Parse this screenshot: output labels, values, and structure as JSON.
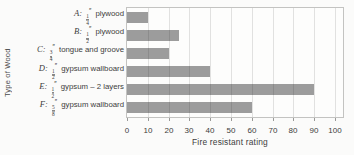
{
  "chart_data": {
    "type": "bar",
    "orientation": "horizontal",
    "title": "",
    "xlabel": "Fire resistant rating",
    "ylabel": "Type of Wood",
    "xlim": [
      0,
      100
    ],
    "xticks": [
      0,
      10,
      20,
      30,
      40,
      50,
      60,
      70,
      80,
      90,
      100
    ],
    "grid": true,
    "legend": false,
    "categories": [
      "A: 1/4″ plywood",
      "B: 1/2″ plywood",
      "C: 3/4″ tongue and groove",
      "D: 1/2″ gypsum wallboard",
      "E: 1/2″ gypsum – 2 layers",
      "F: 5/8″ gypsum wallboard"
    ],
    "values": [
      10,
      25,
      20,
      40,
      90,
      60
    ],
    "items": [
      {
        "letter": "A",
        "num": "1",
        "den": "4",
        "unit": "″",
        "desc": "plywood",
        "value": 10
      },
      {
        "letter": "B",
        "num": "1",
        "den": "2",
        "unit": "″",
        "desc": "plywood",
        "value": 25
      },
      {
        "letter": "C",
        "num": "3",
        "den": "4",
        "unit": "″",
        "desc": "tongue and groove",
        "value": 20
      },
      {
        "letter": "D",
        "num": "1",
        "den": "2",
        "unit": "″",
        "desc": "gypsum wallboard",
        "value": 40
      },
      {
        "letter": "E",
        "num": "1",
        "den": "2",
        "unit": "″",
        "desc": "gypsum – 2 layers",
        "value": 90
      },
      {
        "letter": "F",
        "num": "5",
        "den": "8",
        "unit": "″",
        "desc": "gypsum wallboard",
        "value": 60
      }
    ],
    "colors": {
      "bar": "#9c9c9c",
      "grid": "#d7d7d5",
      "border": "#c3c3c1",
      "text": "#3d3d3d",
      "background": "#fbfbfa"
    }
  }
}
